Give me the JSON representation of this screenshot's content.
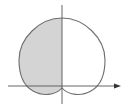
{
  "figure": {
    "colors": {
      "background": "#ffffff",
      "curve": "#6e6e6e",
      "axes": "#555555",
      "shade": "#d4d4d4"
    },
    "axes": {
      "x_axis": {
        "y": 86,
        "x_start": 8,
        "x_end": 120,
        "arrow": true
      },
      "y_axis": {
        "x": 62,
        "y_start": 5,
        "y_end": 104,
        "arrow": false
      }
    },
    "curve": {
      "type": "limacon",
      "center_x": 62,
      "origin_y": 86,
      "top_y": 18,
      "left_x": 19,
      "right_x": 105,
      "bottom_y": 95
    },
    "shaded_region": "left half (x < y-axis) inside curve"
  }
}
